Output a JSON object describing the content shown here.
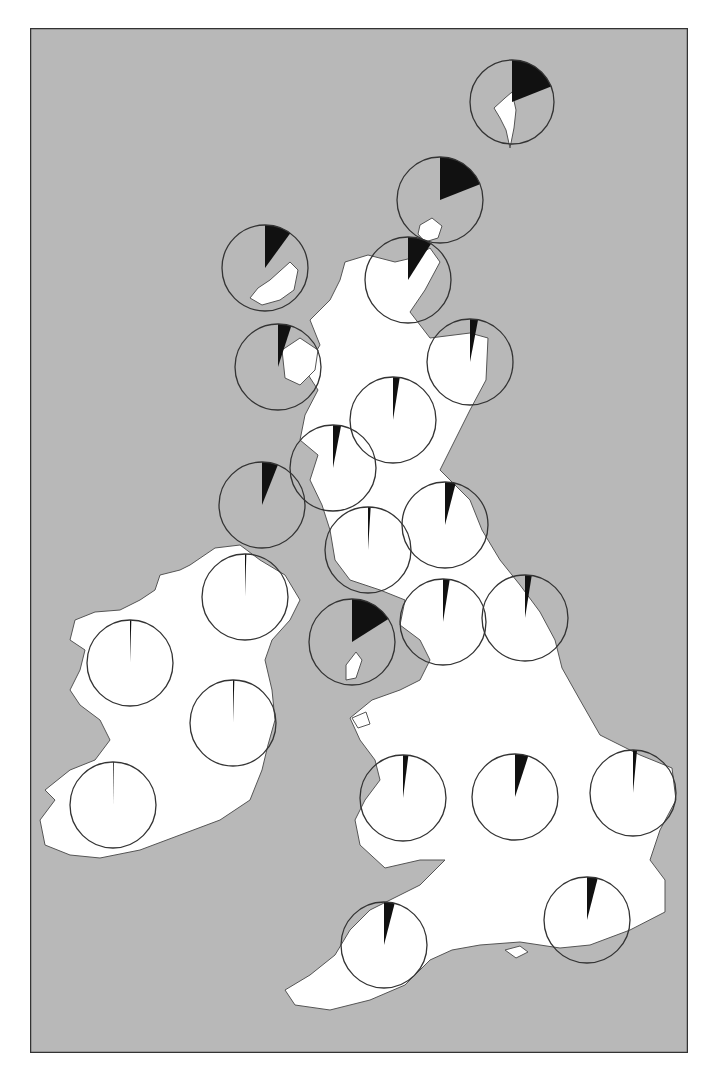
{
  "map": {
    "description": "Map of Britain and Ireland with proportional pie charts by region",
    "colors": {
      "sea": "#b8b8b8",
      "land": "#ffffff",
      "coast": "#555555",
      "frame": "#333333",
      "wedge": "#111111",
      "pie_outline": "#333333"
    },
    "frame": {
      "x": 30,
      "y": 28,
      "width": 658,
      "height": 1025
    }
  },
  "chart_data": {
    "type": "pie",
    "title": "",
    "legend": [],
    "note": "Each circle is a regional pie; the black wedge (starting at 12 o'clock, clockwise) is the estimated share.",
    "pies": [
      {
        "id": "shetland",
        "cx": 512,
        "cy": 102,
        "r": 42,
        "fraction": 0.19
      },
      {
        "id": "orkney",
        "cx": 440,
        "cy": 200,
        "r": 43,
        "fraction": 0.19
      },
      {
        "id": "lewis",
        "cx": 265,
        "cy": 268,
        "r": 43,
        "fraction": 0.1
      },
      {
        "id": "caithness",
        "cx": 408,
        "cy": 280,
        "r": 43,
        "fraction": 0.09
      },
      {
        "id": "skye",
        "cx": 278,
        "cy": 367,
        "r": 43,
        "fraction": 0.05
      },
      {
        "id": "aberdeen",
        "cx": 470,
        "cy": 362,
        "r": 43,
        "fraction": 0.03
      },
      {
        "id": "perth",
        "cx": 393,
        "cy": 420,
        "r": 43,
        "fraction": 0.025
      },
      {
        "id": "argyll",
        "cx": 333,
        "cy": 468,
        "r": 43,
        "fraction": 0.03
      },
      {
        "id": "islay",
        "cx": 262,
        "cy": 505,
        "r": 43,
        "fraction": 0.06
      },
      {
        "id": "borders",
        "cx": 445,
        "cy": 525,
        "r": 43,
        "fraction": 0.04
      },
      {
        "id": "galloway",
        "cx": 368,
        "cy": 550,
        "r": 43,
        "fraction": 0.01
      },
      {
        "id": "northern-ireland",
        "cx": 245,
        "cy": 597,
        "r": 43,
        "fraction": 0.005
      },
      {
        "id": "isle-of-man",
        "cx": 352,
        "cy": 642,
        "r": 43,
        "fraction": 0.16
      },
      {
        "id": "cumbria",
        "cx": 443,
        "cy": 622,
        "r": 43,
        "fraction": 0.025
      },
      {
        "id": "northumberland",
        "cx": 525,
        "cy": 618,
        "r": 43,
        "fraction": 0.025
      },
      {
        "id": "connacht",
        "cx": 130,
        "cy": 663,
        "r": 43,
        "fraction": 0.005
      },
      {
        "id": "leinster",
        "cx": 233,
        "cy": 723,
        "r": 43,
        "fraction": 0.005
      },
      {
        "id": "munster",
        "cx": 113,
        "cy": 805,
        "r": 43,
        "fraction": 0.003
      },
      {
        "id": "wales",
        "cx": 403,
        "cy": 798,
        "r": 43,
        "fraction": 0.02
      },
      {
        "id": "midlands",
        "cx": 515,
        "cy": 797,
        "r": 43,
        "fraction": 0.05
      },
      {
        "id": "east-anglia",
        "cx": 633,
        "cy": 793,
        "r": 43,
        "fraction": 0.015
      },
      {
        "id": "south-west",
        "cx": 384,
        "cy": 945,
        "r": 43,
        "fraction": 0.04
      },
      {
        "id": "south-east",
        "cx": 587,
        "cy": 920,
        "r": 43,
        "fraction": 0.04
      }
    ]
  }
}
